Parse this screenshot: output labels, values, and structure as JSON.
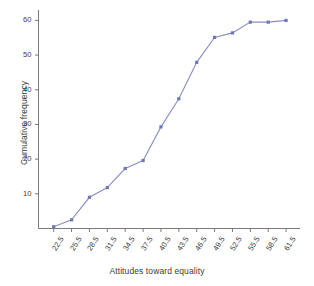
{
  "chart_data": {
    "type": "line",
    "title": "",
    "xlabel": "Attitudes toward equality",
    "ylabel": "Cumulative frequency",
    "categories": [
      "22.5",
      "25.5",
      "28.5",
      "31.5",
      "34.5",
      "37.5",
      "40.5",
      "43.5",
      "46.5",
      "49.5",
      "52.5",
      "55.5",
      "58.5",
      "61.5"
    ],
    "values": [
      0.5,
      2.5,
      9.0,
      11.8,
      17.3,
      19.6,
      29.3,
      37.4,
      47.9,
      55.1,
      56.4,
      59.5,
      59.5,
      60.0
    ],
    "series": [
      {
        "name": "Cumulative frequency",
        "values": [
          0.5,
          2.5,
          9.0,
          11.8,
          17.3,
          19.6,
          29.3,
          37.4,
          47.9,
          55.1,
          56.4,
          59.5,
          59.5,
          60.0
        ]
      }
    ],
    "x_tick_labels": [
      "22.5",
      "25.5",
      "28.5",
      "31.5",
      "34.5",
      "37.5",
      "40.5",
      "43.5",
      "46.5",
      "49.5",
      "52.5",
      "55.5",
      "58.5",
      "61.5"
    ],
    "y_tick_labels": [
      "10",
      "20",
      "30",
      "40",
      "50",
      "60"
    ],
    "y_ticks": [
      10,
      20,
      30,
      40,
      50,
      60
    ],
    "ylim": [
      0,
      63
    ],
    "xlim": [
      0,
      13
    ],
    "grid": false,
    "legend": false,
    "legend_position": "none",
    "line_color": "#8a8fc0",
    "marker_color": "#6f76b5",
    "axis_color": "#7a7a7a",
    "background_color": "#ffffff",
    "marker_style": "square",
    "x_tick_label_rotation": -58
  },
  "axes": {
    "x_title": "Attitudes toward equality",
    "y_title": "Cumulative frequency"
  }
}
